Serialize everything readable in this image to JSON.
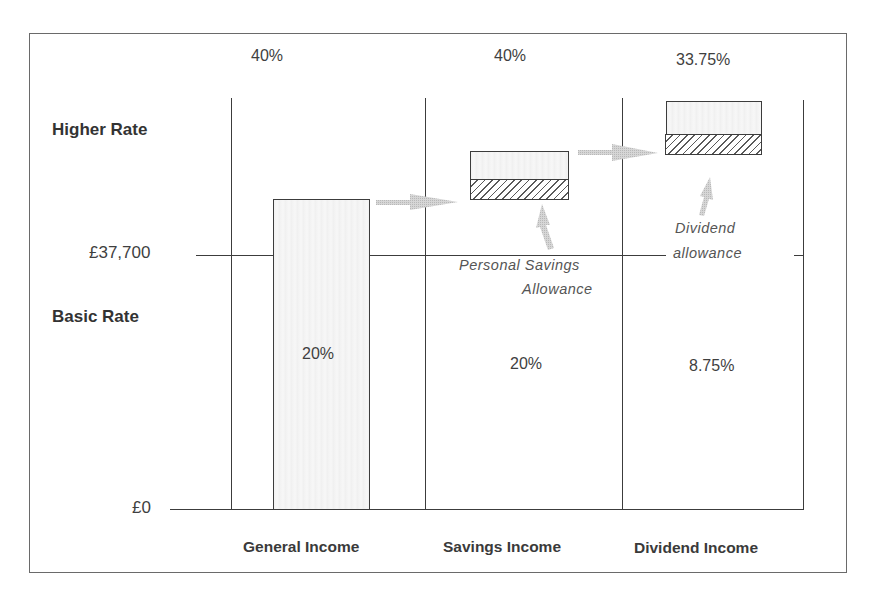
{
  "diagram": {
    "type": "tax-band-comparison",
    "rows": {
      "higher_rate_label": "Higher Rate",
      "basic_rate_label": "Basic Rate"
    },
    "axis": {
      "threshold_label": "£37,700",
      "zero_label": "£0"
    },
    "columns": [
      {
        "name": "General Income",
        "higher_rate": "40%",
        "basic_rate": "20%"
      },
      {
        "name": "Savings Income",
        "higher_rate": "40%",
        "basic_rate": "20%",
        "allowance_label_line1": "Personal Savings",
        "allowance_label_line2": "Allowance"
      },
      {
        "name": "Dividend Income",
        "higher_rate": "33.75%",
        "basic_rate": "8.75%",
        "allowance_label_line1": "Dividend",
        "allowance_label_line2": "allowance"
      }
    ],
    "colors": {
      "line": "#3c3c3c",
      "bar_fill": "#f2f2f2",
      "arrow": "#c8c8c8",
      "text": "#3f3f3f"
    }
  }
}
